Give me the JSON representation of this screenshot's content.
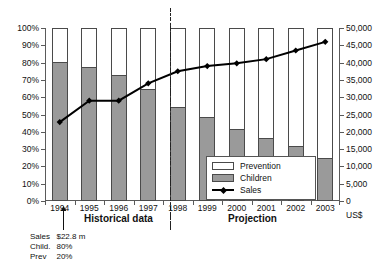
{
  "chart_data": {
    "type": "bar",
    "title": "",
    "subtitle": "",
    "xlabel": "",
    "ylabel": "",
    "grid": false,
    "legend_position": "inside-bottom-right",
    "categories": [
      "1994",
      "1995",
      "1996",
      "1997",
      "1998",
      "1999",
      "2000",
      "2001",
      "2002",
      "2003"
    ],
    "series": [
      {
        "name": "Children",
        "type": "bar",
        "axis": "left",
        "unit": "%",
        "color": "#9a9a9a",
        "values": [
          80,
          77,
          72,
          64,
          54,
          48,
          41,
          36,
          31,
          24
        ]
      },
      {
        "name": "Prevention",
        "type": "bar",
        "axis": "left",
        "unit": "%",
        "color": "#ffffff",
        "values": [
          20,
          23,
          28,
          36,
          46,
          52,
          59,
          64,
          69,
          76
        ]
      },
      {
        "name": "Sales",
        "type": "line",
        "axis": "right",
        "unit": "US$",
        "color": "#000000",
        "values": [
          22800,
          29000,
          29000,
          34000,
          37500,
          39000,
          39800,
          41000,
          43500,
          46000
        ]
      }
    ],
    "left_axis": {
      "label": "",
      "min": 0,
      "max": 100,
      "step": 10,
      "unit": "%",
      "ticks": [
        "0%",
        "10%",
        "20%",
        "30%",
        "40%",
        "50%",
        "60%",
        "70%",
        "80%",
        "90%",
        "100%"
      ]
    },
    "right_axis": {
      "label": "US$",
      "min": 0,
      "max": 50000,
      "step": 5000,
      "ticks": [
        "0",
        "5,000",
        "10,000",
        "15,000",
        "20,000",
        "25,000",
        "30,000",
        "35,000",
        "40,000",
        "45,000",
        "50,000"
      ]
    },
    "divider": {
      "label": "",
      "between": [
        "1998",
        "1999"
      ],
      "style": "dash-dot"
    },
    "region_labels": {
      "historical": "Historical data",
      "projection": "Projection"
    },
    "annotation": {
      "target_category": "1994",
      "rows": [
        {
          "label": "Sales",
          "value": "$22.8 m"
        },
        {
          "label": "Child.",
          "value": "80%"
        },
        {
          "label": "Prev",
          "value": "20%"
        }
      ]
    }
  },
  "legend": {
    "items": [
      {
        "label": "Prevention",
        "swatch": "open-rect-swatch"
      },
      {
        "label": "Children",
        "swatch": "gray-rect-swatch"
      },
      {
        "label": "Sales",
        "swatch": "line-marker-swatch"
      }
    ]
  },
  "colors": {
    "children_fill": "#9a9a9a",
    "prevention_fill": "#ffffff",
    "bar_stroke": "#4a4a4a",
    "sales_line": "#000000",
    "axis": "#5a5a5a",
    "background": "#ffffff"
  }
}
